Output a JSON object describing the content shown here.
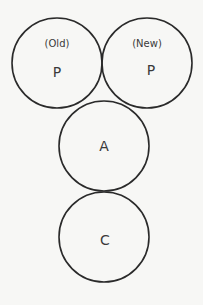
{
  "diagram": {
    "nodes": [
      {
        "id": "old-p",
        "qualifier": "(Old)",
        "label": "P"
      },
      {
        "id": "new-p",
        "qualifier": "(New)",
        "label": "P"
      },
      {
        "id": "a",
        "qualifier": "",
        "label": "A"
      },
      {
        "id": "c",
        "qualifier": "",
        "label": "C"
      }
    ]
  }
}
